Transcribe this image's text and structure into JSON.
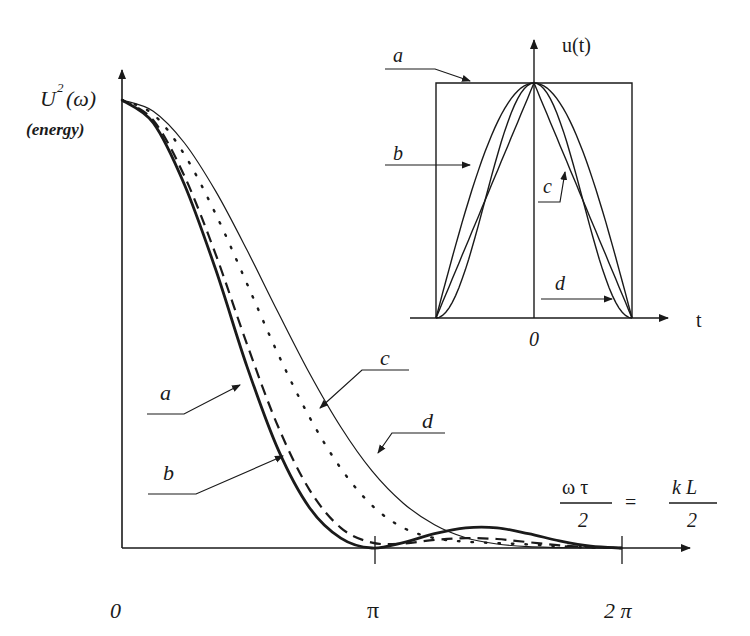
{
  "figure": {
    "main": {
      "y_label": "U",
      "y_label_sup": "2",
      "y_label_arg": "(ω)",
      "y_sublabel": "(energy)",
      "x_origin_label": "0",
      "x_tick_pi": "π",
      "x_tick_2pi": "2 π",
      "x_axis_expr": {
        "lhs_num": "ω τ",
        "lhs_den": "2",
        "eq": "=",
        "rhs_num": "k L",
        "rhs_den": "2"
      },
      "curve_labels": {
        "a": "a",
        "b": "b",
        "c": "c",
        "d": "d"
      }
    },
    "inset": {
      "y_label": "u(t)",
      "x_label": "t",
      "origin_label": "0",
      "curve_labels": {
        "a": "a",
        "b": "b",
        "c": "c",
        "d": "d"
      }
    }
  },
  "chart_data": [
    {
      "type": "line",
      "title": "Energy spectrum of pulse shapes",
      "xlabel": "ωτ/2 = kL/2",
      "ylabel": "U²(ω) (energy)",
      "xlim": [
        0,
        6.2832
      ],
      "xticks": [
        {
          "value": 0,
          "label": "0"
        },
        {
          "value": 3.1416,
          "label": "π"
        },
        {
          "value": 6.2832,
          "label": "2 π"
        }
      ],
      "grid": false,
      "x": [
        0,
        0.3927,
        0.7854,
        1.1781,
        1.5708,
        1.9635,
        2.3562,
        2.7489,
        3.1416,
        3.5343,
        3.927,
        4.3197,
        4.7124,
        5.1051,
        5.4978,
        5.8905,
        6.2832
      ],
      "series": [
        {
          "name": "a",
          "style": "thick solid",
          "values": [
            1.0,
            0.949,
            0.811,
            0.621,
            0.405,
            0.219,
            0.09,
            0.022,
            0.0,
            0.012,
            0.032,
            0.045,
            0.045,
            0.032,
            0.016,
            0.004,
            0.0
          ]
        },
        {
          "name": "b",
          "style": "dashed",
          "values": [
            1.0,
            0.955,
            0.83,
            0.655,
            0.455,
            0.27,
            0.13,
            0.045,
            0.012,
            0.01,
            0.018,
            0.022,
            0.02,
            0.013,
            0.006,
            0.002,
            0.0
          ]
        },
        {
          "name": "c",
          "style": "dotted",
          "values": [
            1.0,
            0.968,
            0.878,
            0.745,
            0.59,
            0.432,
            0.292,
            0.178,
            0.095,
            0.045,
            0.022,
            0.014,
            0.011,
            0.008,
            0.004,
            0.001,
            0.0
          ]
        },
        {
          "name": "d",
          "style": "thin solid",
          "values": [
            1.0,
            0.975,
            0.904,
            0.796,
            0.665,
            0.525,
            0.39,
            0.27,
            0.172,
            0.1,
            0.052,
            0.023,
            0.009,
            0.003,
            0.001,
            0.0,
            0.0
          ]
        }
      ]
    },
    {
      "type": "line",
      "title": "Inset: pulse shapes u(t)",
      "xlabel": "t",
      "ylabel": "u(t)",
      "xticks": [
        {
          "value": 0,
          "label": "0"
        }
      ],
      "x": [
        -1,
        -0.75,
        -0.5,
        -0.25,
        0,
        0.25,
        0.5,
        0.75,
        1
      ],
      "series": [
        {
          "name": "a",
          "shape": "rectangular",
          "values": [
            1,
            1,
            1,
            1,
            1,
            1,
            1,
            1,
            1
          ]
        },
        {
          "name": "b",
          "shape": "cosine",
          "values": [
            0,
            0.383,
            0.707,
            0.924,
            1,
            0.924,
            0.707,
            0.383,
            0
          ]
        },
        {
          "name": "c",
          "shape": "cosine-squared",
          "values": [
            0,
            0.146,
            0.5,
            0.854,
            1,
            0.854,
            0.5,
            0.146,
            0
          ]
        },
        {
          "name": "d",
          "shape": "triangular",
          "values": [
            0,
            0.25,
            0.5,
            0.75,
            1,
            0.75,
            0.5,
            0.25,
            0
          ]
        }
      ]
    }
  ]
}
